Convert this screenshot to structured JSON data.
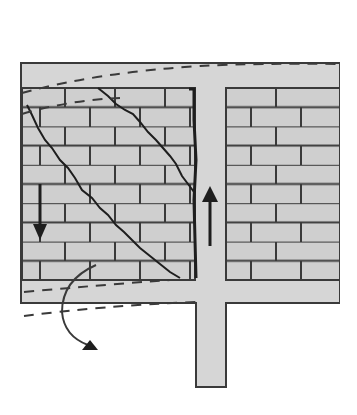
{
  "diagram": {
    "title": "Masonry infill wall in frame with diagonal shear cracks",
    "colors": {
      "background": "#ffffff",
      "frame_fill": "#d6d6d6",
      "brick_fill": "#cfcfcf",
      "line": "#3a3a3a",
      "crack": "#1e1e1e"
    },
    "elements": {
      "frame": "reinforced-concrete-frame",
      "left_panel": "cracked-masonry-infill",
      "right_panel": "intact-masonry-infill",
      "column": "central-column",
      "arrow_down": "downward-force-arrow",
      "arrow_up": "upward-force-arrow",
      "rotation_arrow": "rotation-arrow",
      "deformed_shape": "dashed-deformed-beam-outline"
    }
  }
}
